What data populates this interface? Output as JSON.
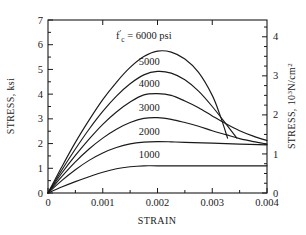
{
  "chart_data": {
    "type": "line",
    "title": "",
    "xlabel": "STRAIN",
    "ylabel": "STRESS, ksi",
    "y2label": "STRESS, 10³N/cm²",
    "xlim": [
      0,
      0.004
    ],
    "ylim": [
      0,
      7
    ],
    "y2lim": [
      0,
      4.43
    ],
    "grid": false,
    "legend_position": "inline-curve-labels",
    "xticks": [
      0,
      0.001,
      0.002,
      0.003,
      0.004
    ],
    "xticklabels": [
      "0",
      "0.001",
      "0.002",
      "0.003",
      "0.004"
    ],
    "yticks": [
      0,
      1,
      2,
      3,
      4,
      5,
      6,
      7
    ],
    "yticklabels": [
      "0",
      "1",
      "2",
      "3",
      "4",
      "5",
      "6",
      "7"
    ],
    "y2ticks": [
      0,
      1,
      2,
      3,
      4
    ],
    "y2ticklabels": [
      "0",
      "1",
      "2",
      "3",
      "4"
    ],
    "annotations": [
      {
        "text": "f'c = 6000 psi",
        "x": 0.00175,
        "y": 6.25
      },
      {
        "text": "5000",
        "x": 0.00185,
        "y": 5.18
      },
      {
        "text": "4000",
        "x": 0.00185,
        "y": 4.28
      },
      {
        "text": "3000",
        "x": 0.00185,
        "y": 3.32
      },
      {
        "text": "2000",
        "x": 0.00185,
        "y": 2.35
      },
      {
        "text": "1000",
        "x": 0.00185,
        "y": 1.42
      }
    ],
    "series": [
      {
        "name": "6000 psi",
        "label": "f'c = 6000 psi",
        "peak_stress_ksi": 5.75,
        "peak_strain": 0.00205,
        "end_strain": 0.00328,
        "end_stress_ksi": 2.22,
        "points": [
          [
            0.0,
            0.0
          ],
          [
            0.00025,
            1.05
          ],
          [
            0.0005,
            2.05
          ],
          [
            0.00075,
            2.95
          ],
          [
            0.001,
            3.78
          ],
          [
            0.00125,
            4.48
          ],
          [
            0.0015,
            5.08
          ],
          [
            0.00175,
            5.52
          ],
          [
            0.002,
            5.74
          ],
          [
            0.00225,
            5.7
          ],
          [
            0.0025,
            5.42
          ],
          [
            0.00275,
            4.88
          ],
          [
            0.003,
            3.95
          ],
          [
            0.00315,
            3.1
          ],
          [
            0.00328,
            2.22
          ]
        ]
      },
      {
        "name": "5000 psi",
        "label": "5000",
        "peak_stress_ksi": 4.92,
        "peak_strain": 0.00195,
        "end_strain": 0.00345,
        "end_stress_ksi": 2.22,
        "points": [
          [
            0.0,
            0.0
          ],
          [
            0.00025,
            0.92
          ],
          [
            0.0005,
            1.78
          ],
          [
            0.00075,
            2.58
          ],
          [
            0.001,
            3.3
          ],
          [
            0.00125,
            3.92
          ],
          [
            0.0015,
            4.42
          ],
          [
            0.00175,
            4.78
          ],
          [
            0.002,
            4.92
          ],
          [
            0.00225,
            4.85
          ],
          [
            0.0025,
            4.58
          ],
          [
            0.00275,
            4.12
          ],
          [
            0.003,
            3.5
          ],
          [
            0.00325,
            2.8
          ],
          [
            0.00345,
            2.22
          ]
        ]
      },
      {
        "name": "4000 psi",
        "label": "4000",
        "peak_stress_ksi": 4.02,
        "peak_strain": 0.00182,
        "end_strain": 0.004,
        "end_stress_ksi": 2.12,
        "points": [
          [
            0.0,
            0.0
          ],
          [
            0.00025,
            0.8
          ],
          [
            0.0005,
            1.52
          ],
          [
            0.00075,
            2.18
          ],
          [
            0.001,
            2.78
          ],
          [
            0.00125,
            3.28
          ],
          [
            0.0015,
            3.68
          ],
          [
            0.00175,
            3.97
          ],
          [
            0.002,
            4.02
          ],
          [
            0.00225,
            3.95
          ],
          [
            0.0025,
            3.72
          ],
          [
            0.00275,
            3.45
          ],
          [
            0.003,
            3.12
          ],
          [
            0.00325,
            2.8
          ],
          [
            0.0035,
            2.52
          ],
          [
            0.00375,
            2.3
          ],
          [
            0.004,
            2.12
          ]
        ]
      },
      {
        "name": "3000 psi",
        "label": "3000",
        "peak_stress_ksi": 3.05,
        "peak_strain": 0.00178,
        "end_strain": 0.004,
        "end_stress_ksi": 1.98,
        "points": [
          [
            0.0,
            0.0
          ],
          [
            0.00025,
            0.66
          ],
          [
            0.0005,
            1.26
          ],
          [
            0.00075,
            1.78
          ],
          [
            0.001,
            2.22
          ],
          [
            0.00125,
            2.58
          ],
          [
            0.0015,
            2.85
          ],
          [
            0.00175,
            3.02
          ],
          [
            0.002,
            3.05
          ],
          [
            0.00225,
            2.98
          ],
          [
            0.0025,
            2.85
          ],
          [
            0.00275,
            2.7
          ],
          [
            0.003,
            2.52
          ],
          [
            0.00325,
            2.36
          ],
          [
            0.0035,
            2.2
          ],
          [
            0.00375,
            2.08
          ],
          [
            0.004,
            1.98
          ]
        ]
      },
      {
        "name": "2000 psi",
        "label": "2000",
        "peak_stress_ksi": 2.08,
        "peak_strain": 0.0018,
        "end_strain": 0.004,
        "end_stress_ksi": 1.95,
        "points": [
          [
            0.0,
            0.0
          ],
          [
            0.00025,
            0.5
          ],
          [
            0.0005,
            0.94
          ],
          [
            0.00075,
            1.32
          ],
          [
            0.001,
            1.62
          ],
          [
            0.00125,
            1.84
          ],
          [
            0.0015,
            1.99
          ],
          [
            0.00175,
            2.06
          ],
          [
            0.002,
            2.08
          ],
          [
            0.00225,
            2.07
          ],
          [
            0.0025,
            2.05
          ],
          [
            0.003,
            2.02
          ],
          [
            0.0035,
            1.98
          ],
          [
            0.004,
            1.95
          ]
        ]
      },
      {
        "name": "1000 psi",
        "label": "1000",
        "peak_stress_ksi": 1.1,
        "peak_strain": 0.0018,
        "end_strain": 0.004,
        "end_stress_ksi": 1.1,
        "points": [
          [
            0.0,
            0.0
          ],
          [
            0.00025,
            0.24
          ],
          [
            0.0005,
            0.46
          ],
          [
            0.00075,
            0.66
          ],
          [
            0.001,
            0.84
          ],
          [
            0.00125,
            0.98
          ],
          [
            0.0015,
            1.06
          ],
          [
            0.00175,
            1.1
          ],
          [
            0.002,
            1.1
          ],
          [
            0.0025,
            1.1
          ],
          [
            0.003,
            1.1
          ],
          [
            0.0035,
            1.1
          ],
          [
            0.004,
            1.1
          ]
        ]
      }
    ]
  },
  "labels": {
    "f_c_prefix": "f",
    "f_c_prime": "′",
    "f_c_sub": "c",
    "f_c_eq": " = 6000 psi",
    "y2_stress": "STRESS, 10",
    "y2_sup3": "3",
    "y2_rest": "N/cm",
    "y2_sup2": "2"
  },
  "colors": {
    "background": "#ffffff",
    "axis": "#1a1a1a",
    "curve": "#1a1a1a",
    "text": "#1a1a1a"
  }
}
